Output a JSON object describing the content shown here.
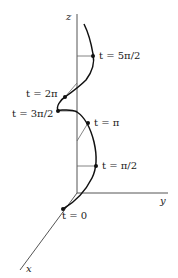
{
  "figure": {
    "type": "3D helix parametric curve",
    "colors": {
      "curve": "#111111",
      "axis": "#555555",
      "background": "#ffffff"
    },
    "axes": {
      "z_label": "z",
      "y_label": "y",
      "x_label": "x"
    },
    "points": [
      {
        "id": "t0",
        "label": "t = 0"
      },
      {
        "id": "t_pi_2",
        "label": "t = π/2"
      },
      {
        "id": "t_pi",
        "label": "t = π"
      },
      {
        "id": "t_3pi_2",
        "label": "t = 3π/2"
      },
      {
        "id": "t_2pi",
        "label": "t = 2π"
      },
      {
        "id": "t_5pi_2",
        "label": "t = 5π/2"
      }
    ]
  }
}
